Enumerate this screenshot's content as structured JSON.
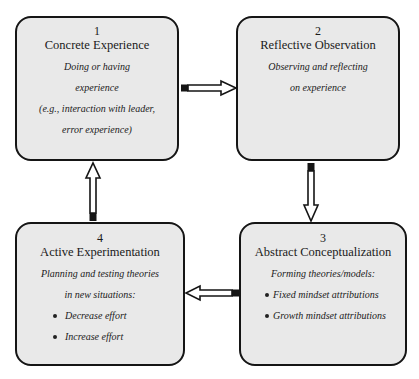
{
  "diagram": {
    "colors": {
      "box_fill": "#e9e9e9",
      "border": "#151515",
      "background": "#ffffff"
    },
    "nodes": [
      {
        "id": "1",
        "number": "1",
        "title": "Concrete Experience",
        "lines": [
          "Doing or having",
          "experience",
          "(e.g., interaction with leader,",
          "error experience)"
        ],
        "bullets": []
      },
      {
        "id": "2",
        "number": "2",
        "title": "Reflective Observation",
        "lines": [
          "Observing and reflecting",
          "on experience"
        ],
        "bullets": []
      },
      {
        "id": "3",
        "number": "3",
        "title": "Abstract Conceptualization",
        "lines": [
          "Forming theories/models:"
        ],
        "bullets": [
          "Fixed mindset attributions",
          "Growth mindset attributions"
        ]
      },
      {
        "id": "4",
        "number": "4",
        "title": "Active Experimentation",
        "lines": [
          "Planning and testing theories",
          "in new situations:"
        ],
        "bullets": [
          "Decrease effort",
          "Increase effort"
        ]
      }
    ],
    "edges": [
      {
        "from": "1",
        "to": "2",
        "direction": "right"
      },
      {
        "from": "2",
        "to": "3",
        "direction": "down"
      },
      {
        "from": "3",
        "to": "4",
        "direction": "left"
      },
      {
        "from": "4",
        "to": "1",
        "direction": "up"
      }
    ]
  }
}
